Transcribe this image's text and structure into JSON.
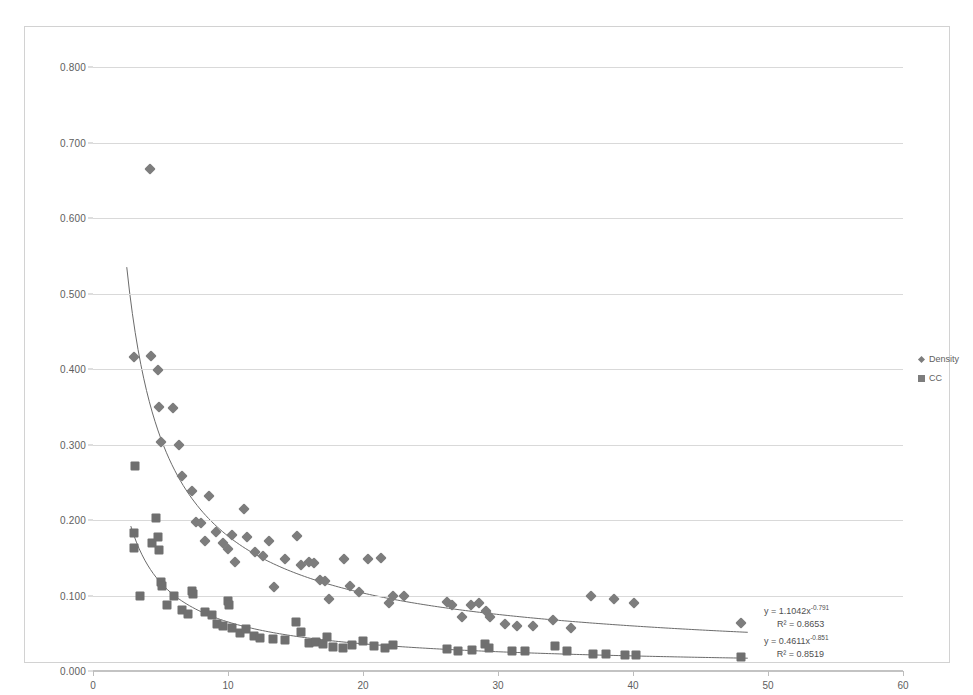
{
  "chart_data": {
    "type": "scatter",
    "title": "",
    "xlabel": "",
    "ylabel": "",
    "xlim": [
      0,
      60
    ],
    "ylim": [
      0.0,
      0.8
    ],
    "grid": true,
    "legend_position": "right",
    "x_ticks": [
      "0",
      "10",
      "20",
      "30",
      "40",
      "50",
      "60"
    ],
    "x_tick_values": [
      0,
      10,
      20,
      30,
      40,
      50,
      60
    ],
    "y_ticks": [
      "0.000",
      "0.100",
      "0.200",
      "0.300",
      "0.400",
      "0.500",
      "0.600",
      "0.700",
      "0.800"
    ],
    "y_tick_values": [
      0.0,
      0.1,
      0.2,
      0.3,
      0.4,
      0.5,
      0.6,
      0.7,
      0.8
    ],
    "series": [
      {
        "name": "Density",
        "marker": "diamond",
        "color": "#7d7d7d",
        "points": [
          [
            3.0,
            0.416
          ],
          [
            4.2,
            0.665
          ],
          [
            4.3,
            0.417
          ],
          [
            4.8,
            0.399
          ],
          [
            4.9,
            0.35
          ],
          [
            5.0,
            0.303
          ],
          [
            5.9,
            0.349
          ],
          [
            6.4,
            0.3
          ],
          [
            6.6,
            0.258
          ],
          [
            7.3,
            0.239
          ],
          [
            7.6,
            0.198
          ],
          [
            8.0,
            0.196
          ],
          [
            8.3,
            0.172
          ],
          [
            8.6,
            0.232
          ],
          [
            9.1,
            0.184
          ],
          [
            9.6,
            0.17
          ],
          [
            10.0,
            0.162
          ],
          [
            10.3,
            0.18
          ],
          [
            10.5,
            0.145
          ],
          [
            11.2,
            0.215
          ],
          [
            11.4,
            0.178
          ],
          [
            12.0,
            0.158
          ],
          [
            12.6,
            0.152
          ],
          [
            13.0,
            0.172
          ],
          [
            13.4,
            0.111
          ],
          [
            14.2,
            0.148
          ],
          [
            15.1,
            0.179
          ],
          [
            15.4,
            0.14
          ],
          [
            16.0,
            0.145
          ],
          [
            16.4,
            0.143
          ],
          [
            16.8,
            0.121
          ],
          [
            17.2,
            0.119
          ],
          [
            17.5,
            0.095
          ],
          [
            18.6,
            0.149
          ],
          [
            19.0,
            0.112
          ],
          [
            19.7,
            0.105
          ],
          [
            20.4,
            0.148
          ],
          [
            21.3,
            0.15
          ],
          [
            21.9,
            0.09
          ],
          [
            22.2,
            0.099
          ],
          [
            23.0,
            0.1
          ],
          [
            26.2,
            0.091
          ],
          [
            26.6,
            0.088
          ],
          [
            27.3,
            0.072
          ],
          [
            28.0,
            0.088
          ],
          [
            28.6,
            0.09
          ],
          [
            29.1,
            0.079
          ],
          [
            29.4,
            0.071
          ],
          [
            30.5,
            0.062
          ],
          [
            31.4,
            0.06
          ],
          [
            32.6,
            0.06
          ],
          [
            34.1,
            0.068
          ],
          [
            35.4,
            0.057
          ],
          [
            36.9,
            0.1
          ],
          [
            38.6,
            0.095
          ],
          [
            40.1,
            0.09
          ],
          [
            48.0,
            0.064
          ]
        ]
      },
      {
        "name": "CC",
        "marker": "square",
        "color": "#6f6f6f",
        "points": [
          [
            3.0,
            0.183
          ],
          [
            3.0,
            0.163
          ],
          [
            3.1,
            0.272
          ],
          [
            3.5,
            0.1
          ],
          [
            4.4,
            0.17
          ],
          [
            4.7,
            0.203
          ],
          [
            4.8,
            0.178
          ],
          [
            4.9,
            0.16
          ],
          [
            5.0,
            0.118
          ],
          [
            5.1,
            0.112
          ],
          [
            5.5,
            0.087
          ],
          [
            6.0,
            0.1
          ],
          [
            6.6,
            0.081
          ],
          [
            7.0,
            0.076
          ],
          [
            7.3,
            0.106
          ],
          [
            7.4,
            0.102
          ],
          [
            8.3,
            0.078
          ],
          [
            8.8,
            0.074
          ],
          [
            9.2,
            0.062
          ],
          [
            9.6,
            0.059
          ],
          [
            10.0,
            0.093
          ],
          [
            10.1,
            0.088
          ],
          [
            10.3,
            0.057
          ],
          [
            10.9,
            0.05
          ],
          [
            11.3,
            0.055
          ],
          [
            11.9,
            0.047
          ],
          [
            12.4,
            0.044
          ],
          [
            13.3,
            0.042
          ],
          [
            14.2,
            0.041
          ],
          [
            15.0,
            0.065
          ],
          [
            15.4,
            0.052
          ],
          [
            16.0,
            0.037
          ],
          [
            16.5,
            0.038
          ],
          [
            17.0,
            0.036
          ],
          [
            17.3,
            0.045
          ],
          [
            17.8,
            0.032
          ],
          [
            18.5,
            0.031
          ],
          [
            19.2,
            0.034
          ],
          [
            20.0,
            0.04
          ],
          [
            20.8,
            0.033
          ],
          [
            21.6,
            0.031
          ],
          [
            22.2,
            0.035
          ],
          [
            26.2,
            0.029
          ],
          [
            27.0,
            0.026
          ],
          [
            28.1,
            0.028
          ],
          [
            29.0,
            0.036
          ],
          [
            29.3,
            0.03
          ],
          [
            31.0,
            0.026
          ],
          [
            32.0,
            0.027
          ],
          [
            34.2,
            0.033
          ],
          [
            35.1,
            0.026
          ],
          [
            37.0,
            0.022
          ],
          [
            38.0,
            0.022
          ],
          [
            39.4,
            0.021
          ],
          [
            40.2,
            0.021
          ],
          [
            48.0,
            0.018
          ]
        ]
      }
    ],
    "trendlines": [
      {
        "series": "Density",
        "type": "power",
        "coefficient": 1.1042,
        "exponent": -0.791,
        "r_squared": 0.8653,
        "equation_prefix": "y = 1.1042x",
        "equation_exponent": "-0.791",
        "r2_text": "R² = 0.8653",
        "x_range": [
          2.5,
          48.5
        ]
      },
      {
        "series": "CC",
        "type": "power",
        "coefficient": 0.4611,
        "exponent": -0.851,
        "r_squared": 0.8519,
        "equation_prefix": "y = 0.4611x",
        "equation_exponent": "-0.851",
        "r2_text": "R² = 0.8519",
        "x_range": [
          2.8,
          48.5
        ]
      }
    ]
  },
  "legend": {
    "items": [
      {
        "label": "Density",
        "marker": "diamond"
      },
      {
        "label": "CC",
        "marker": "square"
      }
    ]
  },
  "annotations": {
    "density_equation": "y = 1.1042x",
    "density_exponent": "-0.791",
    "density_r2": "R² = 0.8653",
    "cc_equation": "y = 0.4611x",
    "cc_exponent": "-0.851",
    "cc_r2": "R² = 0.8519"
  },
  "colors": {
    "marker": "#7d7d7d",
    "gridline": "#d9d9d9",
    "trendline": "#6b6b6b",
    "text": "#5e5e5e"
  }
}
